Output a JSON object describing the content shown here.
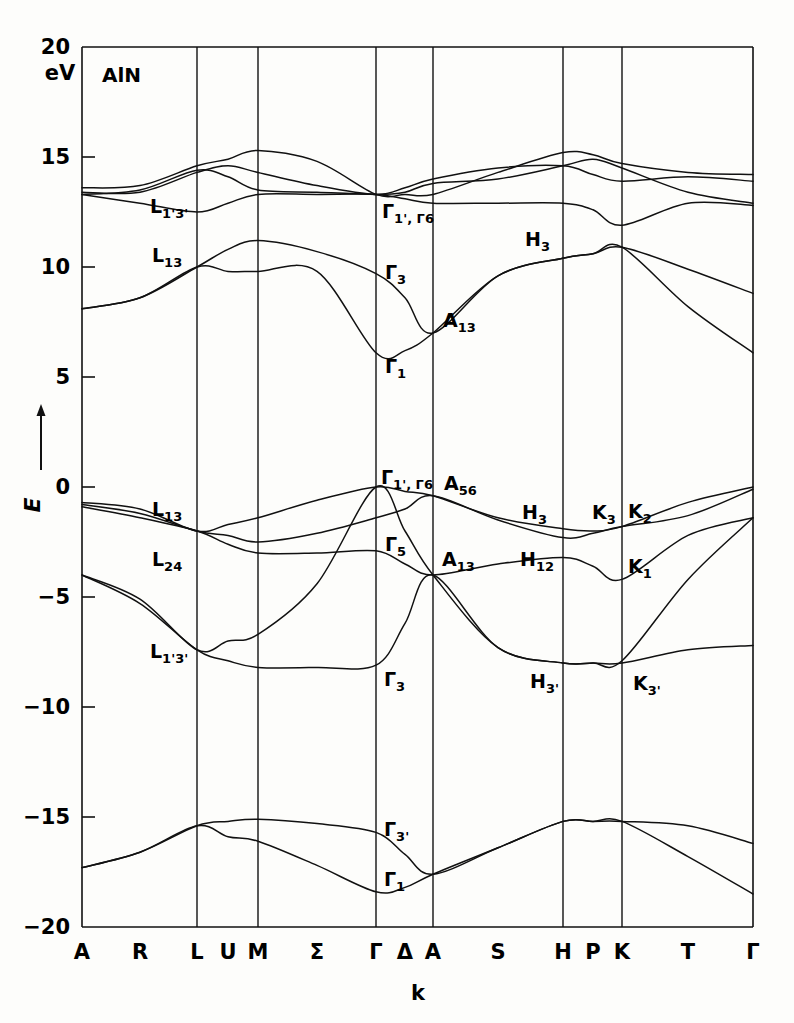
{
  "figure": {
    "material_label": "AlN",
    "energy_unit": "eV",
    "y_axis_title": "E",
    "x_axis_title": "k"
  },
  "chart_data": {
    "type": "line",
    "subtitle": "",
    "xlabel": "k",
    "ylabel": "E",
    "unit": "eV",
    "ylim": [
      -20,
      20
    ],
    "ytick_labels": [
      "20",
      "15",
      "10",
      "5",
      "0",
      "-5",
      "-10",
      "-15",
      "-20"
    ],
    "ytick_values": [
      20,
      15,
      10,
      5,
      0,
      -5,
      -10,
      -15,
      -20
    ],
    "grid": "vertical-symmetry-lines-only",
    "legend": "none",
    "x_tick_labels": [
      "A",
      "R",
      "L",
      "U",
      "M",
      "Σ",
      "Γ",
      "Δ",
      "A",
      "S",
      "H",
      "P",
      "K",
      "T",
      "Γ"
    ],
    "x_symmetry_points": [
      {
        "label": "A",
        "px": 82,
        "line": true
      },
      {
        "label": "R",
        "px": 140,
        "line": false
      },
      {
        "label": "L",
        "px": 197,
        "line": true
      },
      {
        "label": "U",
        "px": 228,
        "line": false
      },
      {
        "label": "M",
        "px": 258,
        "line": true
      },
      {
        "label": "Σ",
        "px": 317,
        "line": false
      },
      {
        "label": "Γ",
        "px": 376,
        "line": true
      },
      {
        "label": "Δ",
        "px": 405,
        "line": false
      },
      {
        "label": "A",
        "px": 433,
        "line": true
      },
      {
        "label": "S",
        "px": 498,
        "line": false
      },
      {
        "label": "H",
        "px": 563,
        "line": true
      },
      {
        "label": "P",
        "px": 593,
        "line": false
      },
      {
        "label": "K",
        "px": 622,
        "line": true
      },
      {
        "label": "T",
        "px": 688,
        "line": false
      },
      {
        "label": "Γ",
        "px": 753,
        "line": true
      }
    ],
    "band_annotations": [
      {
        "text": "L",
        "sub": "1'3'",
        "energy": 12.4,
        "at": "L",
        "px": 150,
        "py": 213
      },
      {
        "text": "L",
        "sub": "13",
        "energy": 10.0,
        "at": "L",
        "px": 152,
        "py": 262
      },
      {
        "text": "Γ",
        "sub": "1', Γ6",
        "energy": 12.4,
        "at": "Γ",
        "px": 382,
        "py": 218
      },
      {
        "text": "Γ",
        "sub": "3",
        "energy": 9.7,
        "at": "Γ",
        "px": 385,
        "py": 279
      },
      {
        "text": "H",
        "sub": "3",
        "energy": 11.2,
        "at": "H",
        "px": 525,
        "py": 246
      },
      {
        "text": "A",
        "sub": "13",
        "energy": 7.0,
        "at": "A",
        "px": 443,
        "py": 327
      },
      {
        "text": "Γ",
        "sub": "1",
        "energy": 6.1,
        "at": "Γ",
        "px": 385,
        "py": 373
      },
      {
        "text": "Γ",
        "sub": "1', Γ6",
        "energy": 0.0,
        "at": "Γ",
        "px": 381,
        "py": 484
      },
      {
        "text": "A",
        "sub": "56",
        "energy": -0.4,
        "at": "A",
        "px": 444,
        "py": 490
      },
      {
        "text": "H",
        "sub": "3",
        "energy": -1.8,
        "at": "H",
        "px": 522,
        "py": 519
      },
      {
        "text": "K",
        "sub": "3",
        "energy": -1.9,
        "at": "K",
        "px": 592,
        "py": 519
      },
      {
        "text": "K",
        "sub": "2",
        "energy": -1.7,
        "at": "K",
        "px": 628,
        "py": 518
      },
      {
        "text": "L",
        "sub": "13",
        "energy": -2.0,
        "at": "L",
        "px": 152,
        "py": 516
      },
      {
        "text": "Γ",
        "sub": "5",
        "energy": -2.9,
        "at": "Γ",
        "px": 385,
        "py": 551
      },
      {
        "text": "A",
        "sub": "13",
        "energy": -4.0,
        "at": "A",
        "px": 442,
        "py": 566
      },
      {
        "text": "H",
        "sub": "12",
        "energy": -3.6,
        "at": "H",
        "px": 520,
        "py": 566
      },
      {
        "text": "L",
        "sub": "24",
        "energy": -3.0,
        "at": "L",
        "px": 152,
        "py": 566
      },
      {
        "text": "K",
        "sub": "1",
        "energy": -4.2,
        "at": "K",
        "px": 628,
        "py": 573
      },
      {
        "text": "L",
        "sub": "1'3'",
        "energy": -7.4,
        "at": "L",
        "px": 150,
        "py": 658
      },
      {
        "text": "Γ",
        "sub": "3",
        "energy": -8.1,
        "at": "Γ",
        "px": 384,
        "py": 686
      },
      {
        "text": "H",
        "sub": "3'",
        "energy": -8.0,
        "at": "H",
        "px": 530,
        "py": 688
      },
      {
        "text": "K",
        "sub": "3'",
        "energy": -8.0,
        "at": "K",
        "px": 633,
        "py": 690
      },
      {
        "text": "Γ",
        "sub": "3'",
        "energy": -15.7,
        "at": "Γ",
        "px": 384,
        "py": 836
      },
      {
        "text": "Γ",
        "sub": "1",
        "energy": -18.0,
        "at": "Γ",
        "px": 384,
        "py": 886
      }
    ],
    "series": [
      {
        "name": "cb-1",
        "points": [
          [
            82,
            13.6
          ],
          [
            140,
            13.7
          ],
          [
            197,
            14.6
          ],
          [
            228,
            14.9
          ],
          [
            258,
            15.3
          ],
          [
            317,
            14.8
          ],
          [
            376,
            13.3
          ],
          [
            405,
            13.3
          ],
          [
            433,
            13.3
          ],
          [
            498,
            14.3
          ],
          [
            563,
            15.2
          ],
          [
            593,
            15.1
          ],
          [
            622,
            14.7
          ],
          [
            688,
            14.3
          ],
          [
            753,
            14.2
          ]
        ]
      },
      {
        "name": "cb-2",
        "points": [
          [
            82,
            13.4
          ],
          [
            140,
            13.4
          ],
          [
            197,
            14.3
          ],
          [
            228,
            14.6
          ],
          [
            258,
            14.3
          ],
          [
            317,
            13.7
          ],
          [
            376,
            13.3
          ],
          [
            405,
            13.6
          ],
          [
            433,
            14.0
          ],
          [
            498,
            14.5
          ],
          [
            563,
            14.6
          ],
          [
            593,
            14.2
          ],
          [
            622,
            13.9
          ],
          [
            688,
            14.1
          ],
          [
            753,
            13.9
          ]
        ]
      },
      {
        "name": "cb-3",
        "points": [
          [
            82,
            13.3
          ],
          [
            140,
            13.5
          ],
          [
            197,
            14.4
          ],
          [
            228,
            14.1
          ],
          [
            258,
            13.5
          ],
          [
            317,
            13.4
          ],
          [
            376,
            13.3
          ],
          [
            405,
            13.4
          ],
          [
            433,
            13.8
          ],
          [
            498,
            14.0
          ],
          [
            563,
            14.6
          ],
          [
            593,
            14.9
          ],
          [
            622,
            14.5
          ],
          [
            688,
            13.4
          ],
          [
            753,
            12.9
          ]
        ]
      },
      {
        "name": "cb-4",
        "points": [
          [
            82,
            13.3
          ],
          [
            140,
            12.9
          ],
          [
            197,
            12.5
          ],
          [
            228,
            12.9
          ],
          [
            258,
            13.3
          ],
          [
            317,
            13.3
          ],
          [
            376,
            13.3
          ],
          [
            405,
            13.1
          ],
          [
            433,
            12.9
          ],
          [
            498,
            12.9
          ],
          [
            563,
            12.9
          ],
          [
            593,
            12.6
          ],
          [
            622,
            11.9
          ],
          [
            688,
            12.9
          ],
          [
            753,
            12.8
          ]
        ]
      },
      {
        "name": "cb-5",
        "points": [
          [
            82,
            8.1
          ],
          [
            140,
            8.6
          ],
          [
            197,
            10.0
          ],
          [
            228,
            10.8
          ],
          [
            258,
            11.2
          ],
          [
            317,
            10.7
          ],
          [
            376,
            9.7
          ],
          [
            405,
            8.6
          ],
          [
            433,
            7.0
          ],
          [
            498,
            9.6
          ],
          [
            563,
            10.4
          ],
          [
            593,
            10.6
          ],
          [
            622,
            10.9
          ],
          [
            688,
            9.9
          ],
          [
            753,
            8.8
          ]
        ]
      },
      {
        "name": "cb-6",
        "points": [
          [
            82,
            8.1
          ],
          [
            140,
            8.6
          ],
          [
            197,
            10.0
          ],
          [
            228,
            9.8
          ],
          [
            258,
            9.8
          ],
          [
            317,
            9.8
          ],
          [
            376,
            6.1
          ],
          [
            405,
            6.2
          ],
          [
            433,
            7.0
          ],
          [
            498,
            9.6
          ],
          [
            563,
            10.4
          ],
          [
            593,
            10.6
          ],
          [
            622,
            10.9
          ],
          [
            688,
            8.2
          ],
          [
            753,
            6.1
          ]
        ]
      },
      {
        "name": "vb-1",
        "points": [
          [
            82,
            -0.7
          ],
          [
            140,
            -1.0
          ],
          [
            197,
            -2.0
          ],
          [
            228,
            -1.7
          ],
          [
            258,
            -1.4
          ],
          [
            317,
            -0.6
          ],
          [
            376,
            0.0
          ],
          [
            405,
            -0.2
          ],
          [
            433,
            -0.4
          ],
          [
            498,
            -1.4
          ],
          [
            563,
            -1.9
          ],
          [
            593,
            -2.0
          ],
          [
            622,
            -1.8
          ],
          [
            688,
            -0.7
          ],
          [
            753,
            0.0
          ]
        ]
      },
      {
        "name": "vb-2",
        "points": [
          [
            82,
            -0.8
          ],
          [
            140,
            -1.2
          ],
          [
            197,
            -2.0
          ],
          [
            228,
            -2.2
          ],
          [
            258,
            -2.5
          ],
          [
            317,
            -2.1
          ],
          [
            376,
            -1.4
          ],
          [
            405,
            -1.0
          ],
          [
            433,
            -0.4
          ],
          [
            498,
            -1.5
          ],
          [
            563,
            -2.3
          ],
          [
            593,
            -2.1
          ],
          [
            622,
            -1.8
          ],
          [
            688,
            -1.3
          ],
          [
            753,
            -0.1
          ]
        ]
      },
      {
        "name": "vb-3",
        "points": [
          [
            82,
            -0.9
          ],
          [
            140,
            -1.4
          ],
          [
            197,
            -2.0
          ],
          [
            228,
            -2.6
          ],
          [
            258,
            -3.0
          ],
          [
            317,
            -3.0
          ],
          [
            376,
            -2.9
          ],
          [
            405,
            -3.5
          ],
          [
            433,
            -4.0
          ],
          [
            498,
            -3.5
          ],
          [
            563,
            -3.2
          ],
          [
            593,
            -3.6
          ],
          [
            622,
            -4.2
          ],
          [
            688,
            -2.2
          ],
          [
            753,
            -1.4
          ]
        ]
      },
      {
        "name": "vb-4",
        "points": [
          [
            82,
            -4.0
          ],
          [
            140,
            -5.1
          ],
          [
            197,
            -7.4
          ],
          [
            228,
            -7.0
          ],
          [
            258,
            -6.7
          ],
          [
            317,
            -4.4
          ],
          [
            376,
            0.0
          ],
          [
            405,
            -2.0
          ],
          [
            433,
            -4.0
          ],
          [
            498,
            -7.3
          ],
          [
            563,
            -8.0
          ],
          [
            593,
            -8.0
          ],
          [
            622,
            -8.0
          ],
          [
            688,
            -7.4
          ],
          [
            753,
            -7.2
          ]
        ]
      },
      {
        "name": "vb-5",
        "points": [
          [
            82,
            -4.0
          ],
          [
            140,
            -5.3
          ],
          [
            197,
            -7.4
          ],
          [
            228,
            -7.9
          ],
          [
            258,
            -8.2
          ],
          [
            317,
            -8.2
          ],
          [
            376,
            -8.1
          ],
          [
            405,
            -6.2
          ],
          [
            433,
            -4.0
          ],
          [
            498,
            -7.3
          ],
          [
            563,
            -8.0
          ],
          [
            593,
            -8.0
          ],
          [
            622,
            -7.9
          ],
          [
            688,
            -4.2
          ],
          [
            753,
            -1.4
          ]
        ]
      },
      {
        "name": "lb-1",
        "points": [
          [
            82,
            -17.3
          ],
          [
            140,
            -16.6
          ],
          [
            197,
            -15.4
          ],
          [
            228,
            -15.2
          ],
          [
            258,
            -15.1
          ],
          [
            317,
            -15.3
          ],
          [
            376,
            -15.7
          ],
          [
            405,
            -16.7
          ],
          [
            433,
            -17.6
          ],
          [
            498,
            -16.4
          ],
          [
            563,
            -15.2
          ],
          [
            593,
            -15.2
          ],
          [
            622,
            -15.2
          ],
          [
            688,
            -15.4
          ],
          [
            753,
            -16.2
          ]
        ]
      },
      {
        "name": "lb-2",
        "points": [
          [
            82,
            -17.3
          ],
          [
            140,
            -16.6
          ],
          [
            197,
            -15.4
          ],
          [
            228,
            -15.9
          ],
          [
            258,
            -16.1
          ],
          [
            317,
            -17.2
          ],
          [
            376,
            -18.4
          ],
          [
            405,
            -18.2
          ],
          [
            433,
            -17.6
          ],
          [
            498,
            -16.4
          ],
          [
            563,
            -15.2
          ],
          [
            593,
            -15.2
          ],
          [
            622,
            -15.2
          ],
          [
            688,
            -16.8
          ],
          [
            753,
            -18.5
          ]
        ]
      }
    ]
  }
}
